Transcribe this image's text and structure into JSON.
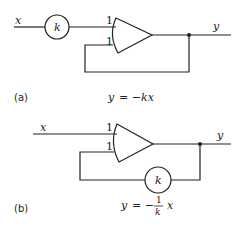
{
  "diagram_a": {
    "input_label": "x",
    "output_label": "y",
    "gain_block_label": "k",
    "amp_input_top_gain": "1",
    "amp_input_bottom_gain": "1",
    "caption": "(a)",
    "equation_lhs": "y",
    "equation_eq": "= −",
    "equation_rhs": "kx"
  },
  "diagram_b": {
    "input_label": "x",
    "output_label": "y",
    "gain_block_label": "k",
    "amp_input_top_gain": "1",
    "amp_input_bottom_gain": "1",
    "caption": "(b)",
    "equation_lhs": "y",
    "equation_eq": "= −",
    "equation_frac_num": "1",
    "equation_frac_den": "k",
    "equation_rhs": "x"
  }
}
